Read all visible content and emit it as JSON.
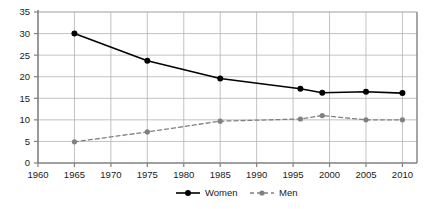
{
  "chart_data": {
    "type": "line",
    "title": "",
    "subtitle": "",
    "xlabel": "",
    "ylabel": "",
    "xlim": [
      1960,
      2012
    ],
    "ylim": [
      0,
      35
    ],
    "yticks": [
      0,
      5,
      10,
      15,
      20,
      25,
      30,
      35
    ],
    "xticks": [
      1960,
      1965,
      1970,
      1975,
      1980,
      1985,
      1990,
      1995,
      2000,
      2005,
      2010
    ],
    "ytick_labels": [
      "0",
      "5",
      "10",
      "15",
      "20",
      "25",
      "30",
      "35"
    ],
    "xtick_labels": [
      "1960",
      "1965",
      "1970",
      "1975",
      "1980",
      "1985",
      "1990",
      "1995",
      "2000",
      "2005",
      "2010"
    ],
    "grid": true,
    "grid_color": "#b3b3b3",
    "axis_color": "#808080",
    "legend_position": "bottom",
    "series": [
      {
        "name": "Women",
        "color": "#000000",
        "line_style": "solid",
        "marker": "circle",
        "x": [
          1965,
          1975,
          1985,
          1996,
          1999,
          2005,
          2010
        ],
        "values": [
          30.0,
          23.7,
          19.6,
          17.2,
          16.3,
          16.5,
          16.2
        ]
      },
      {
        "name": "Men",
        "color": "#808080",
        "line_style": "dashed",
        "marker": "circle",
        "x": [
          1965,
          1975,
          1985,
          1996,
          1999,
          2005,
          2010
        ],
        "values": [
          4.9,
          7.2,
          9.7,
          10.2,
          11.0,
          10.0,
          10.0
        ]
      }
    ],
    "legend": [
      {
        "label": "Women",
        "color": "#000000",
        "line_style": "solid"
      },
      {
        "label": "Men",
        "color": "#808080",
        "line_style": "dashed"
      }
    ]
  }
}
